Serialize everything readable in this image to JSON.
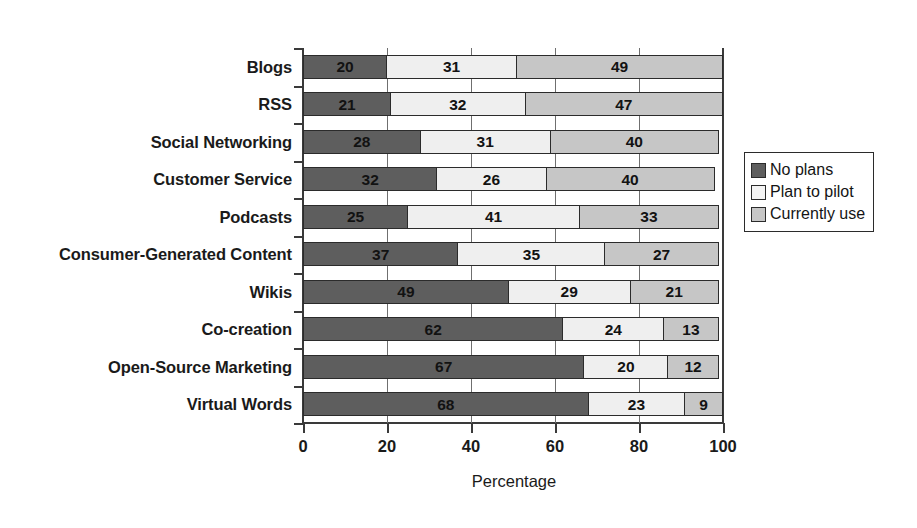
{
  "chart_data": {
    "type": "bar",
    "orientation": "horizontal",
    "stacked": true,
    "stack_total": 100,
    "title": "",
    "xlabel": "Percentage",
    "ylabel": "",
    "xlim": [
      0,
      100
    ],
    "xticks": [
      0,
      20,
      40,
      60,
      80,
      100
    ],
    "xticklabels": [
      "0",
      "20",
      "40",
      "60",
      "80",
      "100"
    ],
    "grid": "vertical",
    "legend_position": "right",
    "categories": [
      "Blogs",
      "RSS",
      "Social Networking",
      "Customer Service",
      "Podcasts",
      "Consumer-Generated Content",
      "Wikis",
      "Co-creation",
      "Open-Source Marketing",
      "Virtual Words"
    ],
    "series": [
      {
        "name": "No plans",
        "color": "#5e5e5e",
        "values": [
          20,
          21,
          28,
          32,
          25,
          37,
          49,
          62,
          67,
          68
        ]
      },
      {
        "name": "Plan to pilot",
        "color": "#efefef",
        "values": [
          31,
          32,
          31,
          26,
          41,
          35,
          29,
          24,
          20,
          23
        ]
      },
      {
        "name": "Currently use",
        "color": "#c6c6c6",
        "values": [
          49,
          47,
          40,
          40,
          33,
          27,
          21,
          13,
          12,
          9
        ]
      }
    ]
  },
  "legend": {
    "items": [
      {
        "label": "No plans",
        "color": "#5e5e5e"
      },
      {
        "label": "Plan to pilot",
        "color": "#f4f4f4"
      },
      {
        "label": "Currently use",
        "color": "#c6c6c6"
      }
    ]
  },
  "colors": {
    "background": "#ffffff",
    "axis": "#3a3a3a",
    "grid": "#6f6f6f",
    "bar_border": "#2b2b2b",
    "text": "#1a1a1a"
  }
}
